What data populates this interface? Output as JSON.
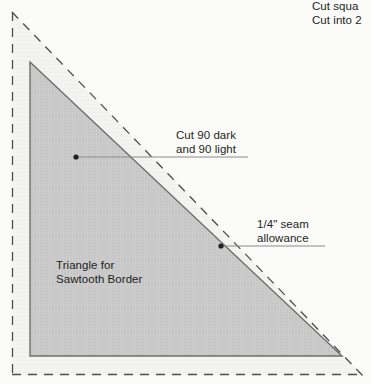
{
  "diagram": {
    "title_note": {
      "line1": "Cut squa",
      "line2": "Cut into 2"
    },
    "labels": {
      "cut_counts": {
        "line1": "Cut 90 dark",
        "line2": "and 90 light"
      },
      "seam_allowance": {
        "line1": "1/4\" seam",
        "line2": "allowance"
      },
      "triangle_name": {
        "line1": "Triangle for",
        "line2": "Sawtooth Border"
      }
    },
    "colors": {
      "background": "#fbfbfa",
      "outer_band_fill": "#f2f2f0",
      "triangle_fill": "#c9c9c9",
      "triangle_stroke": "#6e6e6e",
      "dashed_stroke": "#4d4d4d",
      "leader_stroke": "#6e6e6e",
      "text": "#231f20"
    },
    "geometry": {
      "cut_square_dashed": {
        "left_x": 12,
        "top_y": 12,
        "bottom_y": 375,
        "right_x": 362,
        "hypotenuse": "from (12,12) to (362,375)"
      },
      "sewing_triangle_solid": {
        "apex": "(30,62)",
        "bottom_left": "(30,356)",
        "bottom_right": "(342,356)"
      },
      "seam_allowance_offset_px": 20
    },
    "markers": [
      {
        "name": "cut-counts-dot",
        "x": 76,
        "y": 157
      },
      {
        "name": "seam-allowance-dot",
        "x": 221,
        "y": 246
      }
    ],
    "leader_lines": [
      {
        "name": "cut-counts-leader",
        "from": "(76,157)",
        "to": "(248,157)"
      },
      {
        "name": "seam-allowance-leader",
        "from": "(221,246)",
        "to": "(325,246)"
      }
    ]
  }
}
